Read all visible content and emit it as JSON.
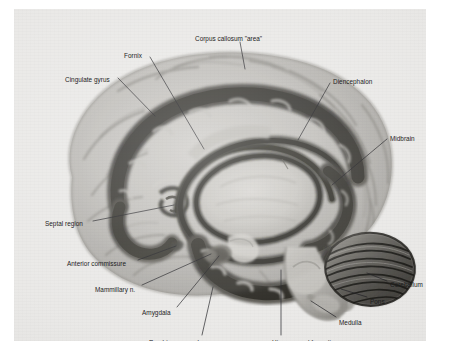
{
  "figure": {
    "kind": "anatomical-illustration",
    "plate_background_color": "#e9e8e6",
    "label_color": "#1d1d1d",
    "leader_line_color": "#15161a"
  },
  "labels": [
    {
      "id": "corpus-callosum-area",
      "text": "Corpus callosum \"area\"",
      "align": "left",
      "x": 181,
      "y": 26
    },
    {
      "id": "fornix",
      "text": "Fornix",
      "align": "left",
      "x": 110,
      "y": 43
    },
    {
      "id": "cingulate-gyrus",
      "text": "Cingulate gyrus",
      "align": "left",
      "x": 51,
      "y": 67
    },
    {
      "id": "diencephalon",
      "text": "Diencephalon",
      "align": "left",
      "x": 319,
      "y": 69
    },
    {
      "id": "midbrain",
      "text": "Midbrain",
      "align": "left",
      "x": 376,
      "y": 126
    },
    {
      "id": "septal-region",
      "text": "Septal region",
      "align": "left",
      "x": 31,
      "y": 211
    },
    {
      "id": "anterior-commissure",
      "text": "Anterior commissure",
      "align": "left",
      "x": 53,
      "y": 251
    },
    {
      "id": "mammillary-n",
      "text": "Mammillary n.",
      "align": "left",
      "x": 81,
      "y": 277
    },
    {
      "id": "amygdala",
      "text": "Amygdala",
      "align": "left",
      "x": 128,
      "y": 300
    },
    {
      "id": "cerebellum",
      "text": "Cerebellum",
      "align": "left",
      "x": 376,
      "y": 272
    },
    {
      "id": "pons",
      "text": "Pons",
      "align": "left",
      "x": 356,
      "y": 289
    },
    {
      "id": "medulla",
      "text": "Medulla",
      "align": "left",
      "x": 325,
      "y": 310
    },
    {
      "id": "parahippocampal-gyrus",
      "text": "Parahippocampal gyrus",
      "align": "left",
      "x": 135,
      "y": 330
    },
    {
      "id": "hippocampal-formation",
      "text": "Hippocampal formation",
      "align": "left",
      "x": 258,
      "y": 330
    }
  ],
  "leader_lines": [
    {
      "id": "corpus-callosum-area",
      "points": "226,33 231,60"
    },
    {
      "id": "fornix",
      "points": "136,48 190,140"
    },
    {
      "id": "cingulate-gyrus",
      "points": "104,69 141,107"
    },
    {
      "id": "diencephalon",
      "points": "316,74 284,131"
    },
    {
      "id": "midbrain",
      "points": "373,130 318,176"
    },
    {
      "id": "septal-region",
      "points": "79,212 160,196"
    },
    {
      "id": "anterior-commissure",
      "points": "124,251 162,237"
    },
    {
      "id": "mammillary-n",
      "points": "128,276 197,245"
    },
    {
      "id": "amygdala",
      "points": "163,298 205,247"
    },
    {
      "id": "cerebellum",
      "points": "373,272 353,264"
    },
    {
      "id": "pons",
      "points": "353,288 327,280"
    },
    {
      "id": "medulla",
      "points": "322,308 297,292"
    },
    {
      "id": "parahippocampal-gyrus",
      "points": "188,326 199,278"
    },
    {
      "id": "hippocampal-formation",
      "points": "267,326 267,261"
    }
  ],
  "structures": [
    {
      "id": "cerebral-hemisphere",
      "name": "Cerebral hemisphere (medial surface)"
    },
    {
      "id": "cingulate-gyrus",
      "name": "Cingulate gyrus"
    },
    {
      "id": "corpus-callosum",
      "name": "Corpus callosum"
    },
    {
      "id": "fornix",
      "name": "Fornix"
    },
    {
      "id": "diencephalon",
      "name": "Diencephalon / thalamus"
    },
    {
      "id": "midbrain",
      "name": "Midbrain"
    },
    {
      "id": "septal-region",
      "name": "Septal region"
    },
    {
      "id": "anterior-commissure",
      "name": "Anterior commissure"
    },
    {
      "id": "mammillary-body",
      "name": "Mammillary nucleus"
    },
    {
      "id": "amygdala",
      "name": "Amygdala"
    },
    {
      "id": "hippocampal-formation",
      "name": "Hippocampal formation"
    },
    {
      "id": "parahippocampal-gyrus",
      "name": "Parahippocampal gyrus"
    },
    {
      "id": "cerebellum",
      "name": "Cerebellum"
    },
    {
      "id": "pons",
      "name": "Pons"
    },
    {
      "id": "medulla",
      "name": "Medulla"
    }
  ]
}
